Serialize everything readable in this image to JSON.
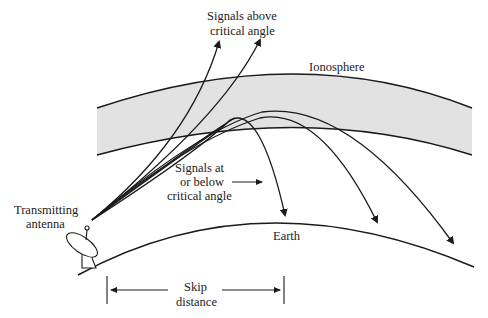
{
  "diagram": {
    "labels": {
      "signals_above_line1": "Signals above",
      "signals_above_line2": "critical angle",
      "ionosphere": "Ionosphere",
      "signals_at_line1": "Signals at",
      "signals_at_line2": "or below",
      "signals_at_line3": "critical angle",
      "transmitting_line1": "Transmitting",
      "transmitting_line2": "antenna",
      "earth": "Earth",
      "skip_line1": "Skip",
      "skip_line2": "distance"
    },
    "colors": {
      "ionosphere_fill": "#e2e2e2",
      "line": "#1a1a1a",
      "text": "#222222"
    }
  }
}
